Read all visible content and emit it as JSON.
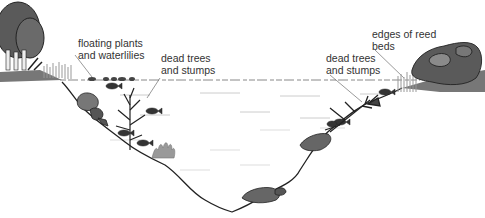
{
  "diagram": {
    "labels": [
      {
        "id": "floating-plants",
        "text": "floating plants\nand waterlilies",
        "x": 78,
        "y": 37
      },
      {
        "id": "dead-trees-left",
        "text": "dead trees\nand stumps",
        "x": 161,
        "y": 52
      },
      {
        "id": "dead-trees-right",
        "text": "dead trees\nand stumps",
        "x": 326,
        "y": 52
      },
      {
        "id": "reed-beds",
        "text": "edges of reed\nbeds",
        "x": 372,
        "y": 28
      }
    ],
    "colors": {
      "outline": "#222222",
      "rock": "#6f6f6f",
      "rock_dark": "#4a4a4a",
      "foliage": "#5a5a5a",
      "foliage_light": "#8a8a8a",
      "weed": "#9a9a9a",
      "water_line": "#888888",
      "text": "#333333"
    }
  }
}
